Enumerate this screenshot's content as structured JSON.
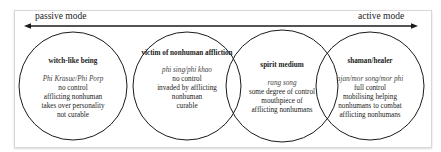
{
  "axis": {
    "left_label": "passive mode",
    "right_label": "active mode",
    "direction": "bidirectional"
  },
  "circles": [
    {
      "title": "witch-like being",
      "term": "Phi Krasue/Phi Porp",
      "lines": [
        "no control",
        "afflicting nonhuman",
        "takes over personality",
        "not curable"
      ]
    },
    {
      "title": "victim of nonhuman affliction",
      "term": "phi sing/phi khao",
      "lines": [
        "no control",
        "invaded by afflicting",
        "nonhuman",
        "curable"
      ]
    },
    {
      "title": "spirit medium",
      "term": "rang song",
      "lines": [
        "some degree of control",
        "mouthpiece of",
        "afflicting nonhumans"
      ]
    },
    {
      "title": "shaman/healer",
      "term": "ajan/mor song/mor phi",
      "lines": [
        "full control",
        "mobilising helping",
        "nonhumans to combat",
        "afflicting nonhumans"
      ]
    }
  ],
  "colors": {
    "line": "#1a1a1a",
    "frame_border": "#d8d8d8"
  }
}
